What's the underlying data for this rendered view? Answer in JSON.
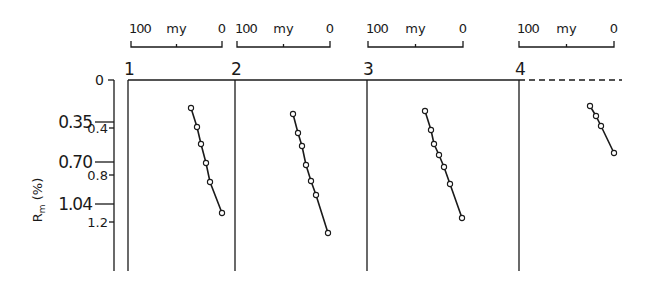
{
  "chart_data": {
    "type": "line",
    "title": "",
    "ylabel": "R_m (%)",
    "ylabel_main": "R",
    "ylabel_sub": "m",
    "ylabel_unit": "(%)",
    "ylim": [
      0,
      1.6
    ],
    "y_ticks_major": [
      {
        "value": 0,
        "label": "0",
        "y": 80
      },
      {
        "value": 0.35,
        "label": "0.35",
        "y": 122
      },
      {
        "value": 0.7,
        "label": "0.70",
        "y": 162
      },
      {
        "value": 1.04,
        "label": "1.04",
        "y": 204
      }
    ],
    "y_ticks_minor": [
      {
        "value": 0.4,
        "label": "0.4",
        "y": 128
      },
      {
        "value": 0.8,
        "label": "0.8",
        "y": 175
      },
      {
        "value": 1.2,
        "label": "1.2",
        "y": 222
      }
    ],
    "x_scale": {
      "label": "my",
      "left_label": "100",
      "right_label": "0",
      "reversed": true
    },
    "panels": [
      {
        "name": "1",
        "scale_bar": {
          "x0": 131,
          "x1": 222
        },
        "left": 128,
        "right": 235,
        "points_px": [
          [
            191,
            108
          ],
          [
            197,
            127
          ],
          [
            201,
            144
          ],
          [
            206,
            163
          ],
          [
            210,
            182
          ],
          [
            222,
            213
          ]
        ],
        "values_R_m": [
          0.24,
          0.4,
          0.54,
          0.7,
          0.86,
          1.12
        ]
      },
      {
        "name": "2",
        "scale_bar": {
          "x0": 237,
          "x1": 330
        },
        "left": 235,
        "right": 367,
        "points_px": [
          [
            293,
            114
          ],
          [
            298,
            133
          ],
          [
            302,
            146
          ],
          [
            306,
            165
          ],
          [
            311,
            181
          ],
          [
            316,
            195
          ],
          [
            328,
            233
          ]
        ],
        "values_R_m": [
          0.29,
          0.45,
          0.56,
          0.72,
          0.85,
          0.97,
          1.29
        ]
      },
      {
        "name": "3",
        "scale_bar": {
          "x0": 368,
          "x1": 463
        },
        "left": 367,
        "right": 519,
        "points_px": [
          [
            425,
            111
          ],
          [
            431,
            130
          ],
          [
            434,
            144
          ],
          [
            439,
            155
          ],
          [
            444,
            167
          ],
          [
            450,
            184
          ],
          [
            462,
            218
          ]
        ],
        "values_R_m": [
          0.26,
          0.42,
          0.54,
          0.63,
          0.73,
          0.88,
          1.16
        ]
      },
      {
        "name": "4",
        "scale_bar": {
          "x0": 519,
          "x1": 614
        },
        "left": 519,
        "right": 622,
        "top_dashed": true,
        "points_px": [
          [
            590,
            106
          ],
          [
            596,
            116
          ],
          [
            601,
            126
          ],
          [
            614,
            153
          ]
        ],
        "values_R_m": [
          0.22,
          0.3,
          0.39,
          0.62
        ]
      }
    ],
    "grid": false,
    "legend": null
  }
}
